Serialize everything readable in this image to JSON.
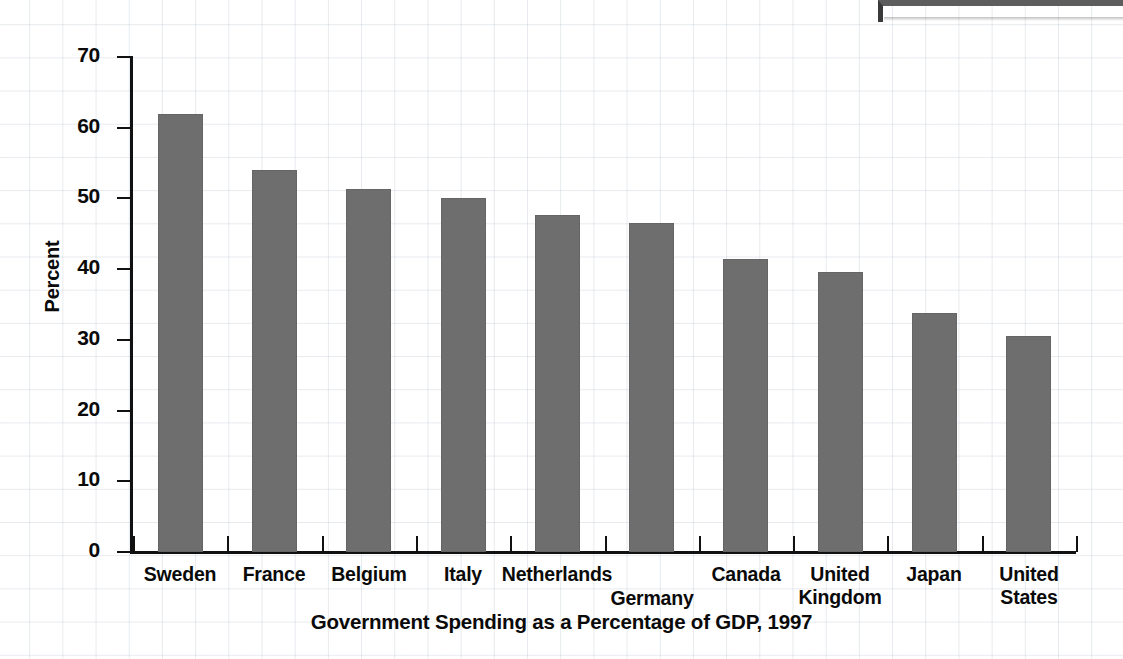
{
  "chart_data": {
    "type": "bar",
    "title": "Government Spending as a Percentage of GDP, 1997",
    "xlabel": "",
    "ylabel": "Percent",
    "ylim": [
      0,
      70
    ],
    "yticks": [
      0,
      10,
      20,
      30,
      40,
      50,
      60,
      70
    ],
    "ytick_labels": [
      "0",
      "10",
      "20",
      "30",
      "40",
      "50",
      "60",
      "70"
    ],
    "grid": true,
    "legend": "none",
    "bar_color": "#6e6e6e",
    "axis_color": "#111111",
    "categories": [
      "Sweden",
      "France",
      "Belgium",
      "Italy",
      "Netherlands",
      "Germany",
      "Canada",
      "United Kingdom",
      "Japan",
      "United States"
    ],
    "values": [
      62.0,
      54.0,
      51.3,
      50.0,
      47.7,
      46.5,
      41.5,
      39.6,
      33.8,
      30.5
    ],
    "points": [
      {
        "category": "Sweden",
        "label": "Sweden",
        "value": 62.0,
        "offset_row": 0
      },
      {
        "category": "France",
        "label": "France",
        "value": 54.0,
        "offset_row": 0
      },
      {
        "category": "Belgium",
        "label": "Belgium",
        "value": 51.3,
        "offset_row": 0
      },
      {
        "category": "Italy",
        "label": "Italy",
        "value": 50.0,
        "offset_row": 0
      },
      {
        "category": "Netherlands",
        "label": "Netherlands",
        "value": 47.7,
        "offset_row": 0
      },
      {
        "category": "Germany",
        "label": "Germany",
        "value": 46.5,
        "offset_row": 1
      },
      {
        "category": "Canada",
        "label": "Canada",
        "value": 41.5,
        "offset_row": 0
      },
      {
        "category": "United Kingdom",
        "label": "United\nKingdom",
        "value": 39.6,
        "offset_row": 0
      },
      {
        "category": "Japan",
        "label": "Japan",
        "value": 33.8,
        "offset_row": 0
      },
      {
        "category": "United States",
        "label": "United\nStates",
        "value": 30.5,
        "offset_row": 0
      }
    ]
  }
}
